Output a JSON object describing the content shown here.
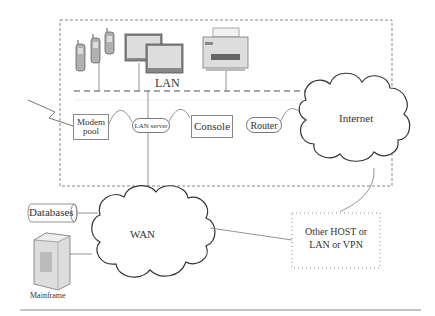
{
  "diagram": {
    "type": "network-topology",
    "lan_group": {
      "label": "LAN"
    },
    "nodes": {
      "modem_pool": {
        "label_line1": "Modem",
        "label_line2": "pool"
      },
      "lan_server": {
        "label": "LAN server"
      },
      "console": {
        "label": "Console"
      },
      "router": {
        "label": "Router"
      },
      "internet": {
        "label": "Internet"
      },
      "wan": {
        "label": "WAN"
      },
      "databases": {
        "label": "Databases"
      },
      "mainframe": {
        "label": "Mainframe"
      },
      "other": {
        "label_line1": "Other HOST or",
        "label_line2": "LAN or VPN"
      }
    },
    "devices": [
      "mobile-phones",
      "monitors",
      "printer"
    ],
    "edges": [
      [
        "mobile-phones",
        "LAN bus"
      ],
      [
        "monitors",
        "LAN bus"
      ],
      [
        "printer",
        "LAN bus"
      ],
      [
        "external-line",
        "Modem pool"
      ],
      [
        "Modem pool",
        "LAN server"
      ],
      [
        "LAN server",
        "Console"
      ],
      [
        "Router",
        "Internet"
      ],
      [
        "LAN bus",
        "WAN"
      ],
      [
        "Databases",
        "WAN"
      ],
      [
        "Mainframe",
        "WAN"
      ],
      [
        "WAN",
        "Other HOST or LAN or VPN"
      ],
      [
        "Internet",
        "Other HOST or LAN or VPN"
      ]
    ]
  }
}
